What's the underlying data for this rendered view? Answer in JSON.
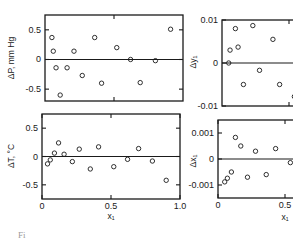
{
  "chart_data": [
    {
      "id": "dP",
      "type": "scatter",
      "title": "",
      "xlabel": "",
      "ylabel": "ΔP, mm Hg",
      "xlim": [
        0,
        1.0
      ],
      "ylim": [
        -0.7,
        0.75
      ],
      "yticks": [
        {
          "v": 0.5,
          "label": "0.5"
        },
        {
          "v": 0,
          "label": "0"
        },
        {
          "v": -0.5,
          "label": "-0.5"
        }
      ],
      "xticks": [
        {
          "v": 0.5,
          "label": ""
        }
      ],
      "grid": false,
      "zero_line": true,
      "points": [
        {
          "x": 0.05,
          "y": 0.37
        },
        {
          "x": 0.06,
          "y": 0.14
        },
        {
          "x": 0.08,
          "y": -0.14
        },
        {
          "x": 0.11,
          "y": -0.6
        },
        {
          "x": 0.16,
          "y": -0.14
        },
        {
          "x": 0.21,
          "y": 0.14
        },
        {
          "x": 0.27,
          "y": -0.27
        },
        {
          "x": 0.36,
          "y": 0.37
        },
        {
          "x": 0.41,
          "y": -0.4
        },
        {
          "x": 0.52,
          "y": 0.2
        },
        {
          "x": 0.62,
          "y": 0.0
        },
        {
          "x": 0.69,
          "y": -0.39
        },
        {
          "x": 0.8,
          "y": -0.02
        },
        {
          "x": 0.91,
          "y": 0.51
        }
      ]
    },
    {
      "id": "dT",
      "type": "scatter",
      "title": "",
      "xlabel": "x₁",
      "ylabel": "ΔT, °C",
      "xlim": [
        0,
        1.0
      ],
      "ylim": [
        -0.75,
        0.75
      ],
      "yticks": [
        {
          "v": 0.5,
          "label": "0.5"
        },
        {
          "v": 0,
          "label": "0"
        },
        {
          "v": -0.5,
          "label": "-0.5"
        }
      ],
      "xticks": [
        {
          "v": 0,
          "label": "0"
        },
        {
          "v": 0.5,
          "label": "0.5"
        },
        {
          "v": 1.0,
          "label": "1.0"
        }
      ],
      "grid": false,
      "zero_line": true,
      "points": [
        {
          "x": 0.04,
          "y": -0.13
        },
        {
          "x": 0.06,
          "y": -0.06
        },
        {
          "x": 0.09,
          "y": 0.06
        },
        {
          "x": 0.12,
          "y": 0.24
        },
        {
          "x": 0.16,
          "y": 0.04
        },
        {
          "x": 0.22,
          "y": -0.09
        },
        {
          "x": 0.27,
          "y": 0.13
        },
        {
          "x": 0.35,
          "y": -0.22
        },
        {
          "x": 0.41,
          "y": 0.17
        },
        {
          "x": 0.52,
          "y": -0.18
        },
        {
          "x": 0.62,
          "y": -0.05
        },
        {
          "x": 0.7,
          "y": 0.14
        },
        {
          "x": 0.8,
          "y": -0.08
        },
        {
          "x": 0.9,
          "y": -0.42
        }
      ]
    },
    {
      "id": "dy1",
      "type": "scatter",
      "title": "",
      "xlabel": "",
      "ylabel": "Δy₁",
      "xlim": [
        0,
        1.0
      ],
      "ylim": [
        -0.01,
        0.01
      ],
      "yticks": [
        {
          "v": 0.01,
          "label": "0.01"
        },
        {
          "v": 0,
          "label": "0"
        },
        {
          "v": -0.01,
          "label": "-0.01"
        }
      ],
      "xticks": [
        {
          "v": 0.5,
          "label": ""
        }
      ],
      "grid": false,
      "zero_line": true,
      "points": [
        {
          "x": 0.05,
          "y": 0.0
        },
        {
          "x": 0.06,
          "y": 0.003
        },
        {
          "x": 0.1,
          "y": 0.008
        },
        {
          "x": 0.12,
          "y": 0.0037
        },
        {
          "x": 0.16,
          "y": -0.005
        },
        {
          "x": 0.23,
          "y": 0.0087
        },
        {
          "x": 0.28,
          "y": -0.0017
        },
        {
          "x": 0.38,
          "y": 0.0055
        },
        {
          "x": 0.43,
          "y": -0.005
        },
        {
          "x": 0.54,
          "y": -0.0078
        }
      ]
    },
    {
      "id": "dx1",
      "type": "scatter",
      "title": "",
      "xlabel": "x₁",
      "ylabel": "Δx₁",
      "xlim": [
        0,
        1.0
      ],
      "ylim": [
        -0.0015,
        0.0015
      ],
      "yticks": [
        {
          "v": 0.001,
          "label": "0.001"
        },
        {
          "v": 0,
          "label": "0"
        },
        {
          "v": -0.001,
          "label": "-0.001"
        }
      ],
      "xticks": [
        {
          "v": 0,
          "label": "0"
        },
        {
          "v": 0.5,
          "label": "0.5"
        }
      ],
      "grid": false,
      "zero_line": true,
      "points": [
        {
          "x": 0.05,
          "y": -0.00088
        },
        {
          "x": 0.07,
          "y": -0.00074
        },
        {
          "x": 0.1,
          "y": -0.0005
        },
        {
          "x": 0.13,
          "y": 0.00083
        },
        {
          "x": 0.17,
          "y": 0.0005
        },
        {
          "x": 0.22,
          "y": -0.0007
        },
        {
          "x": 0.28,
          "y": 0.0003
        },
        {
          "x": 0.36,
          "y": -0.0006
        },
        {
          "x": 0.43,
          "y": 0.0004
        },
        {
          "x": 0.54,
          "y": -0.00014
        }
      ]
    }
  ],
  "caption": "Fi"
}
